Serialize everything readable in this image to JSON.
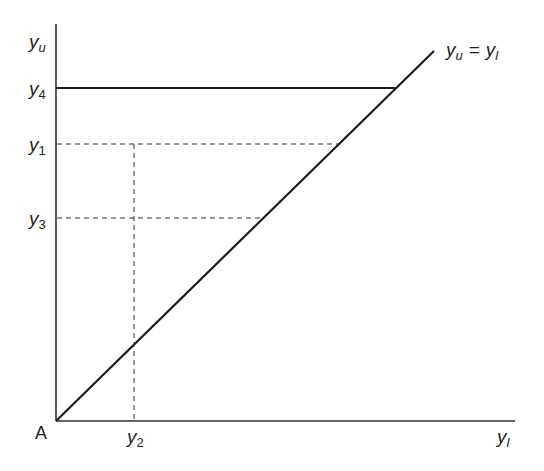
{
  "diagram": {
    "type": "line-diagram",
    "origin_label": "A",
    "x_axis_label": {
      "base": "y",
      "sub": "l"
    },
    "y_axis_label": {
      "base": "y",
      "sub": "u"
    },
    "diagonal_label": {
      "left_base": "y",
      "left_sub": "u",
      "eq": "=",
      "right_base": "y",
      "right_sub": "l"
    },
    "y_ticks": [
      {
        "base": "y",
        "sub": "4",
        "style": "solid"
      },
      {
        "base": "y",
        "sub": "1",
        "style": "dashed"
      },
      {
        "base": "y",
        "sub": "3",
        "style": "dashed"
      }
    ],
    "x_ticks": [
      {
        "base": "y",
        "sub": "2",
        "style": "dashed"
      }
    ],
    "line_color": "#1a1a1a"
  }
}
